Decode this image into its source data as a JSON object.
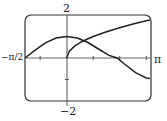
{
  "chart_data": {
    "type": "line",
    "title": "",
    "xlabel": "",
    "ylabel": "",
    "xlim": [
      -1.5708,
      3.1416
    ],
    "ylim": [
      -2,
      2
    ],
    "grid": false,
    "tick_labels": {
      "x_left": "−π/2",
      "x_right": "π",
      "y_top": "2",
      "y_bottom": "−2"
    },
    "x_ticks": [
      -1,
      1,
      2,
      3
    ],
    "y_ticks": [
      -1,
      1
    ],
    "series": [
      {
        "name": "curve-1",
        "x": [
          -1.571,
          -1.2,
          -0.8,
          -0.4,
          0,
          0.4,
          0.8,
          1.2,
          1.6,
          1.9,
          2.2,
          2.6,
          3.0,
          3.142
        ],
        "y": [
          0.0,
          0.36,
          0.7,
          0.93,
          1.0,
          0.93,
          0.72,
          0.42,
          0.12,
          0.0,
          -0.3,
          -0.68,
          -0.93,
          -0.95
        ]
      },
      {
        "name": "curve-2",
        "x": [
          0,
          0.1,
          0.3,
          0.6,
          1.0,
          1.5,
          2.0,
          2.5,
          3.0,
          3.142
        ],
        "y": [
          0.0,
          0.32,
          0.55,
          0.78,
          1.0,
          1.22,
          1.41,
          1.58,
          1.73,
          1.77
        ]
      }
    ]
  }
}
